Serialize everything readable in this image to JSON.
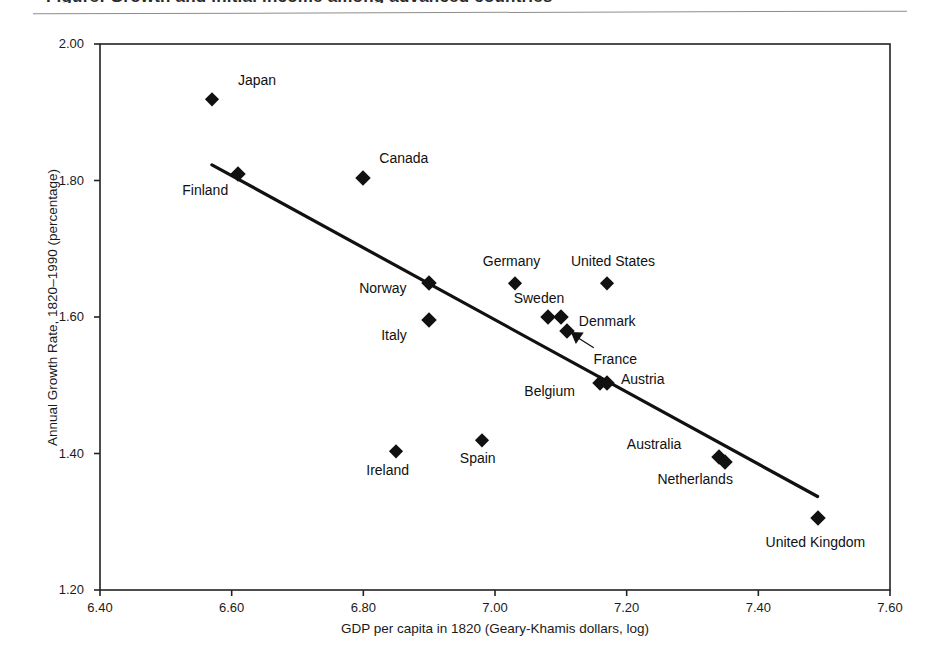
{
  "figure": {
    "title_remnant": "Figure: Growth and initial income among advanced countries",
    "ylabel": "Annual Growth Rate, 1820–1990 (percentage)",
    "xlabel": "GDP per capita in 1820 (Geary-Khamis dollars, log)"
  },
  "chart_data": {
    "type": "scatter",
    "title": "",
    "xlabel": "GDP per capita in 1820 (Geary-Khamis dollars, log)",
    "ylabel": "Annual Growth Rate, 1820–1990 (percentage)",
    "xlim": [
      6.4,
      7.6
    ],
    "ylim": [
      1.2,
      2.0
    ],
    "xticks": [
      "6.40",
      "6.60",
      "6.80",
      "7.00",
      "7.20",
      "7.40",
      "7.60"
    ],
    "yticks": [
      "1.20",
      "1.40",
      "1.60",
      "1.80",
      "2.00"
    ],
    "grid": false,
    "legend": false,
    "marker": "diamond",
    "marker_color": "#111111",
    "points": [
      {
        "label": "Japan",
        "x": 6.57,
        "y": 1.92,
        "label_dx": 26,
        "label_dy": -19
      },
      {
        "label": "Finland",
        "x": 6.61,
        "y": 1.81,
        "label_dx": -56,
        "label_dy": 16
      },
      {
        "label": "Canada",
        "x": 6.8,
        "y": 1.803,
        "label_dx": 16,
        "label_dy": -20
      },
      {
        "label": "Norway",
        "x": 6.9,
        "y": 1.65,
        "label_dx": -70,
        "label_dy": 5
      },
      {
        "label": "Germany",
        "x": 7.03,
        "y": 1.65,
        "label_dx": -32,
        "label_dy": -22
      },
      {
        "label": "United States",
        "x": 7.17,
        "y": 1.65,
        "label_dx": -36,
        "label_dy": -22
      },
      {
        "label": "Italy",
        "x": 6.9,
        "y": 1.595,
        "label_dx": -48,
        "label_dy": 15
      },
      {
        "label": "Sweden",
        "x": 7.08,
        "y": 1.6,
        "label_dx": -34,
        "label_dy": -19
      },
      {
        "label": "Denmark",
        "x": 7.1,
        "y": 1.6,
        "label_dx": 18,
        "label_dy": 4
      },
      {
        "label": "France",
        "x": 7.11,
        "y": 1.58,
        "label_dx": 26,
        "label_dy": 28
      },
      {
        "label": "Belgium",
        "x": 7.16,
        "y": 1.503,
        "label_dx": -76,
        "label_dy": 8
      },
      {
        "label": "Austria",
        "x": 7.17,
        "y": 1.503,
        "label_dx": 14,
        "label_dy": -4
      },
      {
        "label": "Spain",
        "x": 6.98,
        "y": 1.42,
        "label_dx": -22,
        "label_dy": 18
      },
      {
        "label": "Ireland",
        "x": 6.85,
        "y": 1.403,
        "label_dx": -30,
        "label_dy": 19
      },
      {
        "label": "Australia",
        "x": 7.34,
        "y": 1.395,
        "label_dx": -92,
        "label_dy": -13
      },
      {
        "label": "Netherlands",
        "x": 7.35,
        "y": 1.387,
        "label_dx": -68,
        "label_dy": 17
      },
      {
        "label": "United Kingdom",
        "x": 7.49,
        "y": 1.305,
        "label_dx": -52,
        "label_dy": 24
      }
    ],
    "trendline": {
      "type": "linear-fit",
      "x_start": 6.57,
      "y_start": 1.823,
      "x_end": 7.49,
      "y_end": 1.337
    },
    "annotations": [
      {
        "name": "france-leader",
        "text": "",
        "from_x": 7.15,
        "from_y": 1.555,
        "to_x": 7.115,
        "to_y": 1.578
      }
    ]
  }
}
